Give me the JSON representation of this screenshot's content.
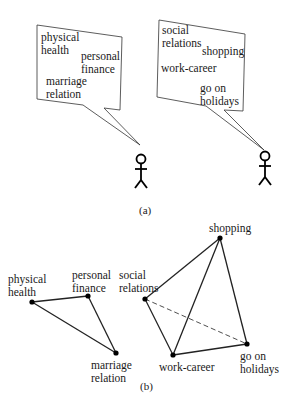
{
  "panel_a": {
    "caption": "(a)",
    "left_bubble": {
      "items": [
        {
          "label": "physical\nhealth",
          "x": 41,
          "y": 31
        },
        {
          "label": "personal\nfinance",
          "x": 81,
          "y": 50
        },
        {
          "label": "marriage\nrelation",
          "x": 46,
          "y": 75
        }
      ]
    },
    "right_bubble": {
      "items": [
        {
          "label": "social\nrelations",
          "x": 162,
          "y": 24
        },
        {
          "label": "shopping",
          "x": 202,
          "y": 45
        },
        {
          "label": "work-career",
          "x": 161,
          "y": 62
        },
        {
          "label": "go on\nholidays",
          "x": 200,
          "y": 82
        }
      ]
    }
  },
  "panel_b": {
    "caption": "(b)",
    "nodes": [
      {
        "id": "physical-health",
        "label": "physical\nhealth",
        "x": 32,
        "y": 302,
        "lx": 8,
        "ly": 273
      },
      {
        "id": "personal-finance",
        "label": "personal\nfinance",
        "x": 88,
        "y": 296,
        "lx": 72,
        "ly": 269
      },
      {
        "id": "marriage-relation",
        "label": "marriage\nrelation",
        "x": 116,
        "y": 353,
        "lx": 91,
        "ly": 359
      },
      {
        "id": "social-relations",
        "label": "social\nrelations",
        "x": 145,
        "y": 299,
        "lx": 119,
        "ly": 269
      },
      {
        "id": "shopping",
        "label": "shopping",
        "x": 220,
        "y": 238,
        "lx": 209,
        "ly": 222
      },
      {
        "id": "work-career",
        "label": "work-career",
        "x": 173,
        "y": 355,
        "lx": 159,
        "ly": 361
      },
      {
        "id": "go-on-holidays",
        "label": "go on\nholidays",
        "x": 247,
        "y": 344,
        "lx": 240,
        "ly": 350
      }
    ],
    "edges": [
      {
        "from": "physical-health",
        "to": "personal-finance",
        "style": "solid"
      },
      {
        "from": "personal-finance",
        "to": "marriage-relation",
        "style": "solid"
      },
      {
        "from": "physical-health",
        "to": "marriage-relation",
        "style": "solid"
      },
      {
        "from": "social-relations",
        "to": "shopping",
        "style": "solid"
      },
      {
        "from": "shopping",
        "to": "work-career",
        "style": "solid"
      },
      {
        "from": "shopping",
        "to": "go-on-holidays",
        "style": "solid"
      },
      {
        "from": "social-relations",
        "to": "work-career",
        "style": "solid"
      },
      {
        "from": "work-career",
        "to": "go-on-holidays",
        "style": "solid"
      },
      {
        "from": "social-relations",
        "to": "go-on-holidays",
        "style": "dashed"
      }
    ]
  }
}
